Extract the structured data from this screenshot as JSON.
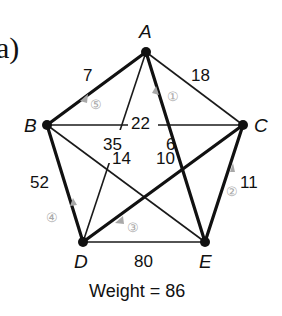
{
  "panel_label": "a)",
  "caption": "Weight = 86",
  "colors": {
    "edge": "#1a1a1a",
    "tour_edge": "#111111",
    "step_marker": "#a8a8a8",
    "node": "#111111"
  },
  "nodes": [
    {
      "id": "A",
      "x": 146,
      "y": 52
    },
    {
      "id": "B",
      "x": 47,
      "y": 125
    },
    {
      "id": "C",
      "x": 243,
      "y": 125
    },
    {
      "id": "D",
      "x": 83,
      "y": 242
    },
    {
      "id": "E",
      "x": 205,
      "y": 242
    }
  ],
  "edges": [
    {
      "from": "A",
      "to": "B",
      "weight": "7",
      "tour": true,
      "step": "⑤"
    },
    {
      "from": "A",
      "to": "C",
      "weight": "18",
      "tour": false
    },
    {
      "from": "A",
      "to": "D",
      "weight": "35",
      "tour": false
    },
    {
      "from": "A",
      "to": "E",
      "weight": "6",
      "tour": true,
      "step": "①"
    },
    {
      "from": "B",
      "to": "C",
      "weight": "22",
      "tour": false
    },
    {
      "from": "B",
      "to": "D",
      "weight": "52",
      "tour": true,
      "step": "④"
    },
    {
      "from": "B",
      "to": "E",
      "weight": "14",
      "tour": false
    },
    {
      "from": "C",
      "to": "D",
      "weight": "10",
      "tour": true,
      "step": "③"
    },
    {
      "from": "C",
      "to": "E",
      "weight": "11",
      "tour": true,
      "step": "②"
    },
    {
      "from": "D",
      "to": "E",
      "weight": "80",
      "tour": false
    }
  ],
  "labels": {
    "A": "A",
    "B": "B",
    "C": "C",
    "D": "D",
    "E": "E",
    "w_AB": "7",
    "w_AC": "18",
    "w_AD": "35",
    "w_AE": "6",
    "w_BC": "22",
    "w_BD": "52",
    "w_BE": "14",
    "w_CD": "10",
    "w_CE": "11",
    "w_DE": "80",
    "step1": "①",
    "step2": "②",
    "step3": "③",
    "step4": "④",
    "step5": "⑤"
  }
}
